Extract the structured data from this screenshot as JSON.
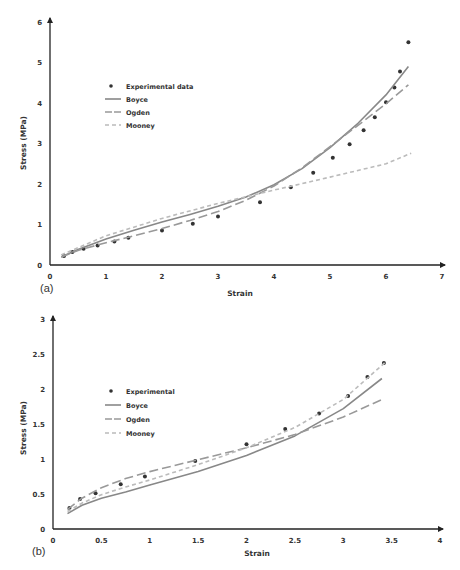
{
  "chart_data": [
    {
      "panel": "(a)",
      "type": "line",
      "title": "",
      "xlabel": "Strain",
      "ylabel": "Stress (MPa)",
      "xlim": [
        0,
        7
      ],
      "ylim": [
        0,
        6
      ],
      "xticks": [
        "0",
        "1",
        "2",
        "3",
        "4",
        "5",
        "6",
        "7"
      ],
      "yticks": [
        "0",
        "1",
        "2",
        "3",
        "4",
        "5",
        "6"
      ],
      "grid": false,
      "legend_position": "upper-left-inside",
      "legend": [
        "Experimental data",
        "Boyce",
        "Ogden",
        "Mooney"
      ],
      "series": [
        {
          "name": "Experimental data",
          "style": "markers",
          "color": "#333333",
          "x": [
            0.25,
            0.4,
            0.6,
            0.85,
            1.15,
            1.4,
            2.0,
            2.55,
            3.0,
            3.75,
            4.3,
            4.7,
            5.05,
            5.35,
            5.6,
            5.8,
            6.0,
            6.15,
            6.25,
            6.4
          ],
          "y": [
            0.22,
            0.32,
            0.4,
            0.48,
            0.58,
            0.67,
            0.85,
            1.02,
            1.2,
            1.55,
            1.92,
            2.28,
            2.65,
            2.98,
            3.33,
            3.65,
            4.02,
            4.38,
            4.78,
            5.5
          ]
        },
        {
          "name": "Boyce",
          "style": "solid",
          "color": "#888888",
          "x": [
            0.2,
            0.5,
            1,
            1.5,
            2,
            2.5,
            3,
            3.5,
            4,
            4.5,
            5,
            5.5,
            6,
            6.4
          ],
          "y": [
            0.2,
            0.38,
            0.64,
            0.86,
            1.06,
            1.25,
            1.45,
            1.68,
            1.98,
            2.38,
            2.9,
            3.5,
            4.2,
            4.9
          ]
        },
        {
          "name": "Ogden",
          "style": "long-dash",
          "color": "#999999",
          "x": [
            0.2,
            0.5,
            1,
            1.5,
            2,
            2.5,
            3,
            3.5,
            4,
            4.5,
            5,
            5.5,
            6,
            6.4
          ],
          "y": [
            0.2,
            0.36,
            0.55,
            0.72,
            0.9,
            1.1,
            1.32,
            1.6,
            1.95,
            2.4,
            2.92,
            3.45,
            3.98,
            4.45
          ]
        },
        {
          "name": "Mooney",
          "style": "short-dash",
          "color": "#bbbbbb",
          "x": [
            0.2,
            1,
            2,
            3,
            4,
            5,
            6,
            6.45
          ],
          "y": [
            0.25,
            0.72,
            1.15,
            1.52,
            1.85,
            2.17,
            2.5,
            2.76
          ]
        }
      ]
    },
    {
      "panel": "(b)",
      "type": "line",
      "title": "",
      "xlabel": "Strain",
      "ylabel": "Stress (MPa)",
      "xlim": [
        0,
        4
      ],
      "ylim": [
        0,
        3
      ],
      "xticks": [
        "0",
        "0.5",
        "1",
        "1.5",
        "2",
        "2.5",
        "3",
        "3.5",
        "4"
      ],
      "yticks": [
        "0",
        "0.5",
        "1",
        "1.5",
        "2",
        "2.5",
        "3"
      ],
      "grid": false,
      "legend_position": "upper-left-inside",
      "legend": [
        "Experimental",
        "Boyce",
        "Ogden",
        "Mooney"
      ],
      "series": [
        {
          "name": "Experimental",
          "style": "markers",
          "color": "#333333",
          "x": [
            0.17,
            0.28,
            0.44,
            0.7,
            0.95,
            1.47,
            2.0,
            2.4,
            2.75,
            3.05,
            3.25,
            3.42
          ],
          "y": [
            0.3,
            0.43,
            0.51,
            0.64,
            0.75,
            0.97,
            1.21,
            1.43,
            1.65,
            1.9,
            2.17,
            2.37
          ]
        },
        {
          "name": "Boyce",
          "style": "solid",
          "color": "#888888",
          "x": [
            0.15,
            0.3,
            0.5,
            0.75,
            1,
            1.5,
            2,
            2.5,
            3,
            3.4
          ],
          "y": [
            0.22,
            0.34,
            0.44,
            0.53,
            0.63,
            0.82,
            1.05,
            1.33,
            1.72,
            2.15
          ]
        },
        {
          "name": "Ogden",
          "style": "long-dash",
          "color": "#999999",
          "x": [
            0.15,
            0.3,
            0.5,
            0.75,
            1,
            1.5,
            2,
            2.5,
            3,
            3.4
          ],
          "y": [
            0.28,
            0.44,
            0.59,
            0.72,
            0.82,
            0.99,
            1.16,
            1.35,
            1.6,
            1.85
          ]
        },
        {
          "name": "Mooney",
          "style": "short-dash",
          "color": "#bbbbbb",
          "x": [
            0.15,
            0.3,
            0.5,
            0.75,
            1,
            1.5,
            2,
            2.5,
            3,
            3.45
          ],
          "y": [
            0.25,
            0.37,
            0.49,
            0.6,
            0.7,
            0.92,
            1.16,
            1.45,
            1.85,
            2.4
          ]
        }
      ]
    }
  ]
}
